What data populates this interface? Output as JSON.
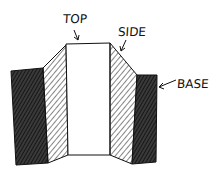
{
  "diagram": {
    "labels": {
      "top": "TOP",
      "side": "SIDE",
      "base": "BASE"
    },
    "colors": {
      "ink": "#111111",
      "background": "#ffffff",
      "top_fill": "#ffffff",
      "base_fill": "#2a2a2a",
      "side_hatch": "#333333"
    }
  }
}
